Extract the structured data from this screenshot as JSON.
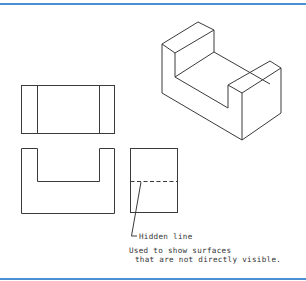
{
  "figure": {
    "colors": {
      "rule": "#4a8fd4",
      "line": "#3a3a3a",
      "text": "#333333",
      "background": "#ffffff"
    },
    "views": {
      "isometric": {
        "label": "isometric-view"
      },
      "top": {
        "label": "top-view"
      },
      "front": {
        "label": "front-view"
      },
      "side": {
        "label": "right-side-view"
      }
    },
    "annotation": {
      "callout": "Hidden line",
      "description_line1": "Used to show surfaces",
      "description_line2": "that are not directly visible."
    }
  }
}
